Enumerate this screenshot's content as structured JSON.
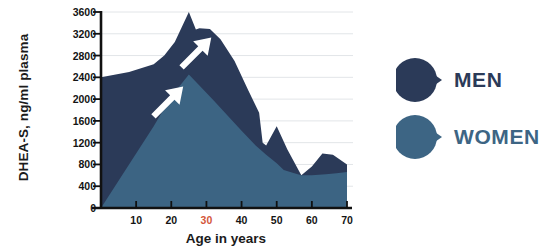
{
  "chart_data": {
    "type": "area",
    "title": "",
    "subtitle": "",
    "xlabel": "Age in years",
    "ylabel": "DHEA-S, ng/ml plasma",
    "xlim": [
      0,
      70
    ],
    "ylim": [
      0,
      3600
    ],
    "grid": true,
    "grid_axis": "y",
    "legend_position": "right",
    "xticks": [
      10,
      20,
      30,
      40,
      50,
      60,
      70
    ],
    "xtick_labels": [
      "10",
      "20",
      "30",
      "40",
      "50",
      "60",
      "70"
    ],
    "xtick_highlight": "30",
    "xtick_highlight_color": "#d4563a",
    "yticks": [
      0,
      400,
      800,
      1200,
      1600,
      2000,
      2400,
      2800,
      3200,
      3600
    ],
    "ytick_labels": [
      "0",
      "400",
      "800",
      "1200",
      "1600",
      "2000",
      "2400",
      "2800",
      "3200",
      "3600"
    ],
    "series": [
      {
        "name": "MEN",
        "color": "#2b3a58",
        "x": [
          0,
          8,
          15,
          18,
          21,
          25,
          27,
          28,
          31,
          34,
          38,
          42,
          45,
          46,
          47,
          50,
          53,
          57,
          60,
          63,
          66,
          70
        ],
        "values": [
          2400,
          2500,
          2640,
          2800,
          3050,
          3600,
          3280,
          3300,
          3290,
          3100,
          2700,
          2150,
          1750,
          1200,
          1150,
          1500,
          1080,
          600,
          760,
          1000,
          980,
          800
        ]
      },
      {
        "name": "WOMEN",
        "color": "#3d6584",
        "x": [
          0,
          5,
          10,
          15,
          20,
          25,
          28,
          32,
          36,
          40,
          44,
          47,
          50,
          52,
          55,
          57,
          60,
          64,
          67,
          70
        ],
        "values": [
          0,
          500,
          1000,
          1500,
          2050,
          2450,
          2250,
          1980,
          1700,
          1420,
          1150,
          980,
          820,
          700,
          640,
          600,
          600,
          620,
          640,
          660
        ]
      }
    ],
    "annotations": [
      {
        "type": "arrow",
        "label": "women-rise-arrow",
        "x": 20,
        "y": 2100,
        "direction": "up-right",
        "color": "#ffffff"
      },
      {
        "type": "arrow",
        "label": "men-peak-arrow",
        "x": 28,
        "y": 3000,
        "direction": "up-right",
        "color": "#ffffff"
      }
    ]
  },
  "legend": {
    "items": [
      {
        "label": "MEN",
        "color": "#2b3a58",
        "marker": "teardrop-circle-marker"
      },
      {
        "label": "WOMEN",
        "color": "#3d6584",
        "marker": "teardrop-circle-marker"
      }
    ]
  },
  "axes": {
    "axis_color": "#111111",
    "gridline_color": "#e2e5e8"
  }
}
